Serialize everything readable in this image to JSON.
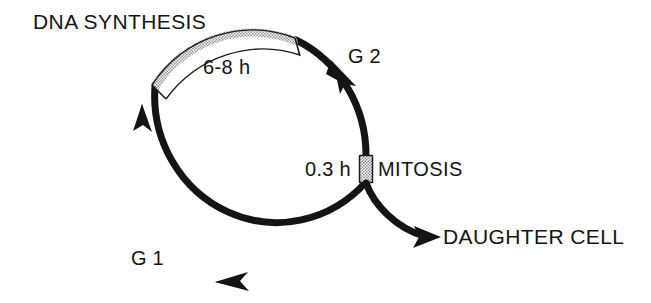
{
  "diagram": {
    "type": "cell-cycle-diagram",
    "background_color": "#ffffff",
    "stroke_color": "#141414",
    "stipple_fill_color": "#d8d8d8",
    "labels": {
      "dna_synthesis": "DNA SYNTHESIS",
      "s_phase_duration": "6-8 h",
      "g2_phase": "G 2",
      "mitosis_duration": "0.3 h",
      "mitosis": "MITOSIS",
      "g1_phase": "G 1",
      "daughter_cell": "DAUGHTER CELL"
    },
    "phases": [
      {
        "name": "DNA SYNTHESIS",
        "short": "S",
        "duration": "6-8 h",
        "style": "stippled",
        "position": "top-arc"
      },
      {
        "name": "G 2",
        "short": "G2",
        "duration": "",
        "style": "solid",
        "position": "upper-right-arc"
      },
      {
        "name": "MITOSIS",
        "short": "M",
        "duration": "0.3 h",
        "style": "stippled",
        "position": "right"
      },
      {
        "name": "G 1",
        "short": "G1",
        "duration": "",
        "style": "solid",
        "position": "lower-left-arc"
      }
    ],
    "flow_direction": "counterclockwise",
    "branch": {
      "label": "DAUGHTER CELL",
      "origin": "MITOSIS",
      "arrow": "right"
    },
    "arrowheads": [
      {
        "name": "g2-arrowhead",
        "on": "upper-right-arc"
      },
      {
        "name": "g1-bottom-arrowhead",
        "on": "bottom-arc"
      },
      {
        "name": "s-entry-arrowhead",
        "on": "left-arc"
      },
      {
        "name": "daughter-cell-arrowhead",
        "on": "branch"
      }
    ]
  }
}
